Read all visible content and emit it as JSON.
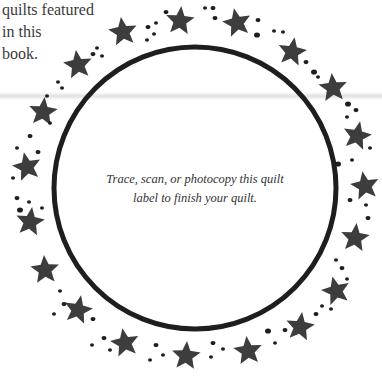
{
  "side_text": {
    "lines": [
      "quilts featured",
      "in this",
      "book."
    ]
  },
  "label": {
    "lines": [
      "Trace, scan, or photocopy this quilt",
      "label to finish your quilt."
    ]
  },
  "circle": {
    "cx": 195,
    "cy": 188,
    "r": 141,
    "stroke_width": 5,
    "color": "#1e1e1e"
  },
  "star_color": "#3d3d3d",
  "stars": [
    {
      "x": 123,
      "y": 32,
      "r": 15,
      "rot": -8
    },
    {
      "x": 180,
      "y": 21,
      "r": 15,
      "rot": 5
    },
    {
      "x": 237,
      "y": 23,
      "r": 15,
      "rot": -12
    },
    {
      "x": 292,
      "y": 52,
      "r": 15,
      "rot": 10
    },
    {
      "x": 333,
      "y": 88,
      "r": 15,
      "rot": -5
    },
    {
      "x": 357,
      "y": 136,
      "r": 15,
      "rot": 12
    },
    {
      "x": 365,
      "y": 186,
      "r": 15,
      "rot": -10
    },
    {
      "x": 355,
      "y": 238,
      "r": 15,
      "rot": 6
    },
    {
      "x": 336,
      "y": 291,
      "r": 15,
      "rot": -14
    },
    {
      "x": 300,
      "y": 327,
      "r": 15,
      "rot": 8
    },
    {
      "x": 248,
      "y": 351,
      "r": 15,
      "rot": -6
    },
    {
      "x": 186,
      "y": 356,
      "r": 15,
      "rot": 4
    },
    {
      "x": 125,
      "y": 343,
      "r": 15,
      "rot": -10
    },
    {
      "x": 78,
      "y": 310,
      "r": 15,
      "rot": 12
    },
    {
      "x": 45,
      "y": 270,
      "r": 15,
      "rot": -4
    },
    {
      "x": 30,
      "y": 222,
      "r": 15,
      "rot": 8
    },
    {
      "x": 27,
      "y": 167,
      "r": 15,
      "rot": -12
    },
    {
      "x": 43,
      "y": 112,
      "r": 15,
      "rot": 6
    },
    {
      "x": 78,
      "y": 65,
      "r": 15,
      "rot": -8
    }
  ],
  "dots": [
    [
      93,
      54,
      2.5
    ],
    [
      97,
      48,
      2
    ],
    [
      102,
      56,
      2
    ],
    [
      58,
      82,
      2
    ],
    [
      62,
      88,
      2
    ],
    [
      47,
      96,
      2
    ],
    [
      148,
      27,
      2.5
    ],
    [
      147,
      40,
      2
    ],
    [
      156,
      23,
      2
    ],
    [
      166,
      12,
      2.5
    ],
    [
      154,
      34,
      2
    ],
    [
      205,
      8,
      2
    ],
    [
      213,
      8,
      2.5
    ],
    [
      215,
      18,
      2.5
    ],
    [
      258,
      20,
      2.5
    ],
    [
      257,
      35,
      3
    ],
    [
      274,
      31,
      2
    ],
    [
      283,
      32,
      2
    ],
    [
      306,
      62,
      2.5
    ],
    [
      314,
      72,
      3
    ],
    [
      318,
      77,
      2
    ],
    [
      348,
      104,
      3
    ],
    [
      356,
      110,
      2.5
    ],
    [
      347,
      117,
      2
    ],
    [
      370,
      148,
      2
    ],
    [
      338,
      164,
      3
    ],
    [
      352,
      160,
      2
    ],
    [
      350,
      200,
      2.5
    ],
    [
      366,
      205,
      2
    ],
    [
      368,
      218,
      2.5
    ],
    [
      336,
      260,
      2
    ],
    [
      342,
      268,
      2.5
    ],
    [
      347,
      279,
      2
    ],
    [
      322,
      306,
      2
    ],
    [
      331,
      309,
      2
    ],
    [
      316,
      314,
      2.5
    ],
    [
      268,
      331,
      3
    ],
    [
      285,
      330,
      2.5
    ],
    [
      275,
      343,
      2
    ],
    [
      213,
      343,
      2.5
    ],
    [
      223,
      349,
      2
    ],
    [
      211,
      357,
      2
    ],
    [
      156,
      345,
      2.5
    ],
    [
      163,
      355,
      2
    ],
    [
      150,
      360,
      2
    ],
    [
      93,
      319,
      2.5
    ],
    [
      104,
      338,
      2.5
    ],
    [
      92,
      345,
      2
    ],
    [
      110,
      350,
      2
    ],
    [
      60,
      291,
      2
    ],
    [
      64,
      304,
      2.5
    ],
    [
      54,
      314,
      2
    ],
    [
      17,
      198,
      2.5
    ],
    [
      20,
      210,
      3
    ],
    [
      29,
      202,
      2
    ],
    [
      42,
      208,
      2
    ],
    [
      17,
      148,
      2
    ],
    [
      38,
      152,
      2.5
    ],
    [
      13,
      178,
      2
    ],
    [
      30,
      136,
      2.5
    ],
    [
      50,
      123,
      2
    ]
  ]
}
